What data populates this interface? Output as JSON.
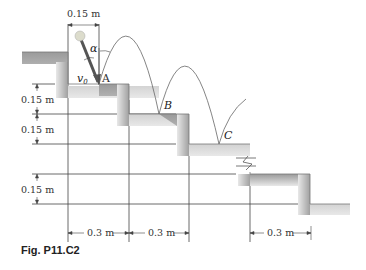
{
  "figure": {
    "caption": "Fig. P11.C2",
    "top_dimension": "0.15 m",
    "vertical_dimensions": [
      "0.15 m",
      "0.15 m",
      "0.15 m"
    ],
    "horizontal_dimensions": [
      "0.3 m",
      "0.3 m",
      "0.3 m"
    ],
    "points": {
      "A": "A",
      "B": "B",
      "C": "C"
    },
    "angle_label": "α",
    "velocity_label": "v0",
    "velocity_sub": "0"
  },
  "colors": {
    "stair_fill_light": "#e2e2e2",
    "stair_fill_dark": "#a8a8a8",
    "line": "#333333",
    "ball": "#d8d8c8"
  }
}
